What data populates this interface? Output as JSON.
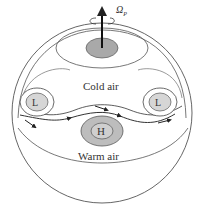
{
  "diagram": {
    "rotation_label": "Ω",
    "rotation_subscript": "P",
    "regions": {
      "cold": "Cold air",
      "warm": "Warm air"
    },
    "pressure_systems": [
      {
        "label": "L",
        "position": "left"
      },
      {
        "label": "L",
        "position": "right"
      },
      {
        "label": "H",
        "position": "center"
      }
    ],
    "colors": {
      "line": "#444444",
      "fill_gray": "#b5b5b5",
      "fill_light": "#dcdcdc",
      "background": "#ffffff"
    }
  }
}
